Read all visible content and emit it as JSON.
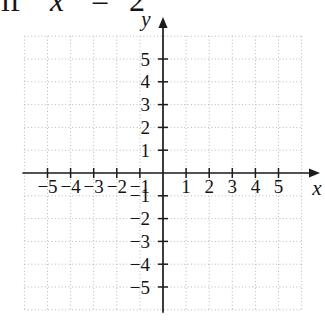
{
  "header": {
    "fragments": [
      "if",
      "x",
      "=",
      "2"
    ]
  },
  "chart_data": {
    "type": "scatter",
    "title": "",
    "subtitle": "empty coordinate grid, no plotted data",
    "xlabel": "x",
    "ylabel": "y",
    "xlim": [
      -6,
      6
    ],
    "ylim": [
      -6,
      6
    ],
    "x_ticks": [
      -5,
      -4,
      -3,
      -2,
      -1,
      1,
      2,
      3,
      4,
      5
    ],
    "y_ticks": [
      -5,
      -4,
      -3,
      -2,
      -1,
      1,
      2,
      3,
      4,
      5
    ],
    "grid": true,
    "grid_style": "dotted",
    "legend": false,
    "series": []
  },
  "colors": {
    "axis": "#1c1c1c",
    "grid": "#b8b8b8",
    "text": "#141414",
    "background": "#ffffff"
  }
}
